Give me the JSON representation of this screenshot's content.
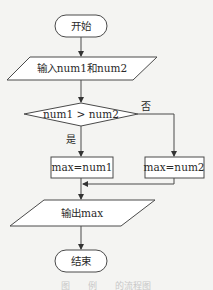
{
  "flowchart": {
    "start": {
      "label": "开始"
    },
    "input": {
      "label": "输入num1和num2"
    },
    "decision": {
      "label": "num1 > num2",
      "yes_label": "是",
      "no_label": "否"
    },
    "assign_yes": {
      "label": "max=num1"
    },
    "assign_no": {
      "label": "max=num2"
    },
    "output": {
      "label": "输出max"
    },
    "end": {
      "label": "结束"
    }
  },
  "caption": "图　　例　　的流程图"
}
